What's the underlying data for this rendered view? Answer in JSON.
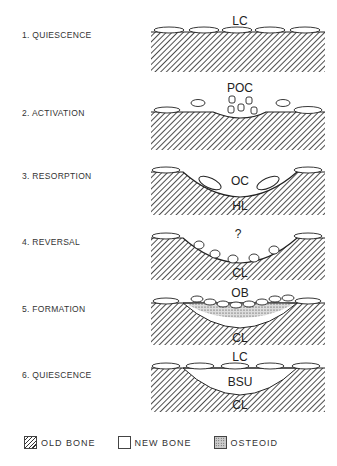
{
  "steps": [
    {
      "label": "1. QUIESCENCE",
      "annotations": [
        "LC"
      ]
    },
    {
      "label": "2. ACTIVATION",
      "annotations": [
        "POC"
      ]
    },
    {
      "label": "3. RESORPTION",
      "annotations": [
        "OC",
        "HL"
      ]
    },
    {
      "label": "4. REVERSAL",
      "annotations": [
        "?",
        "CL"
      ]
    },
    {
      "label": "5. FORMATION",
      "annotations": [
        "OB",
        "CL"
      ]
    },
    {
      "label": "6. QUIESCENCE",
      "annotations": [
        "LC",
        "BSU",
        "CL"
      ]
    }
  ],
  "legend": [
    {
      "label": "OLD BONE",
      "pattern": "hatched"
    },
    {
      "label": "NEW BONE",
      "pattern": "blank"
    },
    {
      "label": "OSTEOID",
      "pattern": "stippled"
    }
  ]
}
